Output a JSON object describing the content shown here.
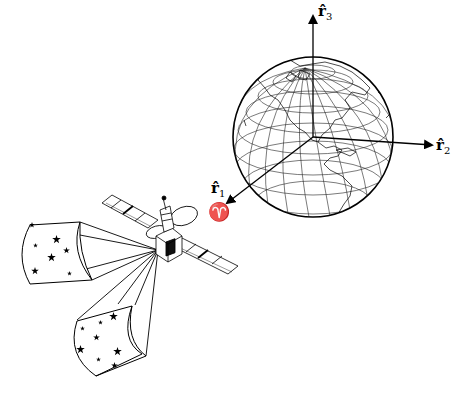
{
  "diagram": {
    "colors": {
      "line": "#000000",
      "background": "#ffffff"
    },
    "axes": [
      {
        "id": "r1",
        "label_base": "r̂",
        "label_sub": "1",
        "direction": "toward vernal equinox"
      },
      {
        "id": "r2",
        "label_base": "r̂",
        "label_sub": "2",
        "direction": "right"
      },
      {
        "id": "r3",
        "label_base": "r̂",
        "label_sub": "3",
        "direction": "up"
      }
    ],
    "vernal_equinox_symbol": "♈",
    "globe": {
      "center": [
        313,
        137
      ],
      "radius": 80,
      "meridians": 12,
      "parallels": 8
    },
    "satellite": {
      "solar_panels": 2,
      "antenna_dishes": 2
    },
    "star_fields": [
      {
        "id": "fov-upper-left",
        "star_count": 7
      },
      {
        "id": "fov-lower",
        "star_count": 9
      }
    ]
  }
}
